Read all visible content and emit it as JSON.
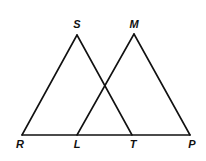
{
  "figure": {
    "type": "geometry",
    "points": {
      "S": "S",
      "M": "M",
      "R": "R",
      "L": "L",
      "T": "T",
      "P": "P"
    },
    "triangles": [
      [
        "R",
        "S",
        "T"
      ],
      [
        "L",
        "M",
        "P"
      ]
    ],
    "collinear": [
      "R",
      "L",
      "T",
      "P"
    ]
  }
}
